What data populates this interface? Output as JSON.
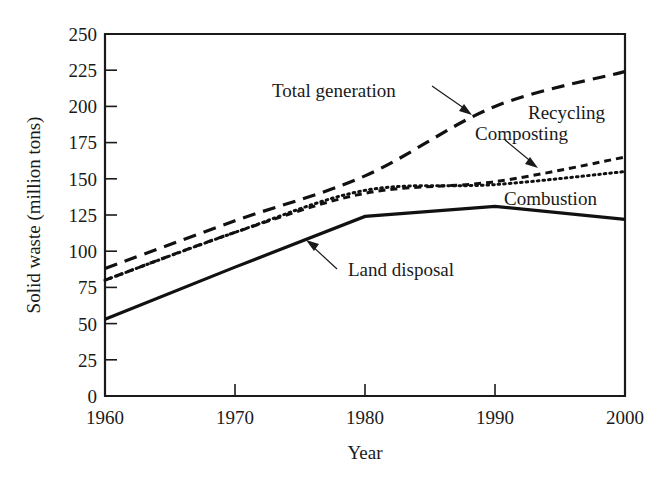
{
  "chart_data": {
    "type": "line",
    "title": "",
    "xlabel": "Year",
    "ylabel": "Solid waste (million tons)",
    "xlim": [
      1960,
      2000
    ],
    "ylim": [
      0,
      250
    ],
    "grid": false,
    "legend_position": "inline-annotations",
    "x_ticks": [
      "1960",
      "1970",
      "1980",
      "1990",
      "2000"
    ],
    "x_tick_values": [
      1960,
      1970,
      1980,
      1990,
      2000
    ],
    "y_ticks": [
      "0",
      "25",
      "50",
      "75",
      "100",
      "125",
      "150",
      "175",
      "200",
      "225",
      "250"
    ],
    "y_tick_values": [
      0,
      25,
      50,
      75,
      100,
      125,
      150,
      175,
      200,
      225,
      250
    ],
    "x": [
      1960,
      1970,
      1980,
      1990,
      2000
    ],
    "series": [
      {
        "name": "Total generation",
        "style": "long-dashed",
        "values": [
          88,
          121,
          152,
          200,
          224
        ]
      },
      {
        "name": "Recycling Composting",
        "style": "short-dashed",
        "values": [
          80,
          113,
          140,
          148,
          165
        ]
      },
      {
        "name": "Combustion",
        "style": "dotted",
        "values": [
          80,
          113,
          142,
          146,
          155
        ]
      },
      {
        "name": "Land disposal",
        "style": "solid",
        "values": [
          53,
          89,
          124,
          131,
          122
        ]
      }
    ],
    "annotations": [
      {
        "text": "Total generation",
        "x": 1987,
        "y": 185
      },
      {
        "text": "Recycling",
        "x": 1993,
        "y": 178
      },
      {
        "text": "Composting",
        "x": 1991,
        "y": 164
      },
      {
        "text": "Combustion",
        "x": 1996,
        "y": 138
      },
      {
        "text": "Land disposal",
        "x": 1980,
        "y": 110
      }
    ]
  },
  "axes": {
    "y_title": "Solid waste (million tons)",
    "x_title": "Year",
    "y_labels": [
      "250",
      "225",
      "200",
      "175",
      "150",
      "125",
      "100",
      "75",
      "50",
      "25",
      "0"
    ],
    "x_labels": [
      "1960",
      "1970",
      "1980",
      "1990",
      "2000"
    ]
  },
  "labels": {
    "total_generation": "Total generation",
    "recycling": "Recycling",
    "composting": "Composting",
    "combustion": "Combustion",
    "land_disposal": "Land disposal"
  }
}
